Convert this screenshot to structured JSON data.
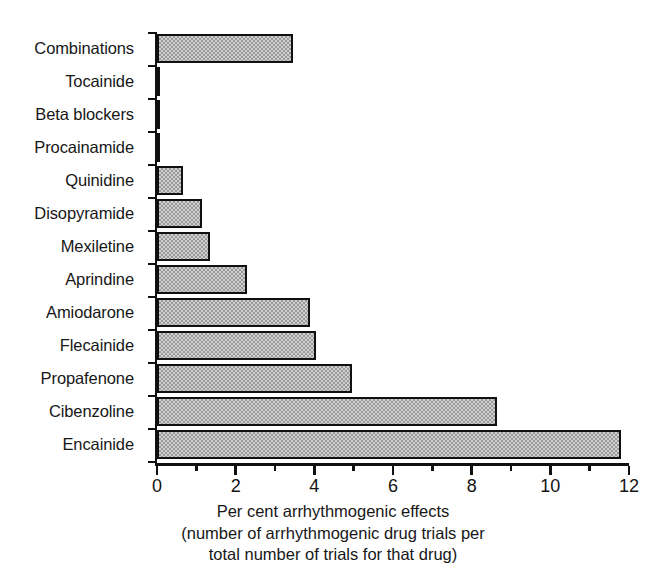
{
  "chart_data": {
    "type": "bar",
    "orientation": "horizontal",
    "title": "",
    "xlabel": "Per cent arrhythmogenic effects (number of arrhythmogenic drug trials per total number of trials for that drug)",
    "ylabel": "",
    "xlim": [
      0,
      12
    ],
    "grid": false,
    "legend": null,
    "x_major_ticks": [
      "0",
      "2",
      "4",
      "6",
      "8",
      "10",
      "12"
    ],
    "x_minor_ticks": [
      "1",
      "3",
      "5",
      "7",
      "9",
      "11"
    ],
    "categories": [
      "Combinations",
      "Tocainide",
      "Beta blockers",
      "Procainamide",
      "Quinidine",
      "Disopyramide",
      "Mexiletine",
      "Aprindine",
      "Amiodarone",
      "Flecainide",
      "Propafenone",
      "Cibenzoline",
      "Encainide"
    ],
    "values": [
      3.45,
      0.05,
      0.05,
      0.05,
      0.65,
      1.15,
      1.35,
      2.3,
      3.9,
      4.05,
      4.95,
      8.65,
      11.8
    ],
    "bar_fill_color": "#cfcfcf",
    "bar_pattern": "checkerboard-stipple",
    "bar_edge_color": "#101010",
    "axis_color": "#101010"
  },
  "caption": {
    "line1": "Per cent arrhythmogenic effects",
    "line2": "(number of arrhythmogenic drug trials per",
    "line3": "total number of trials for that drug)"
  }
}
